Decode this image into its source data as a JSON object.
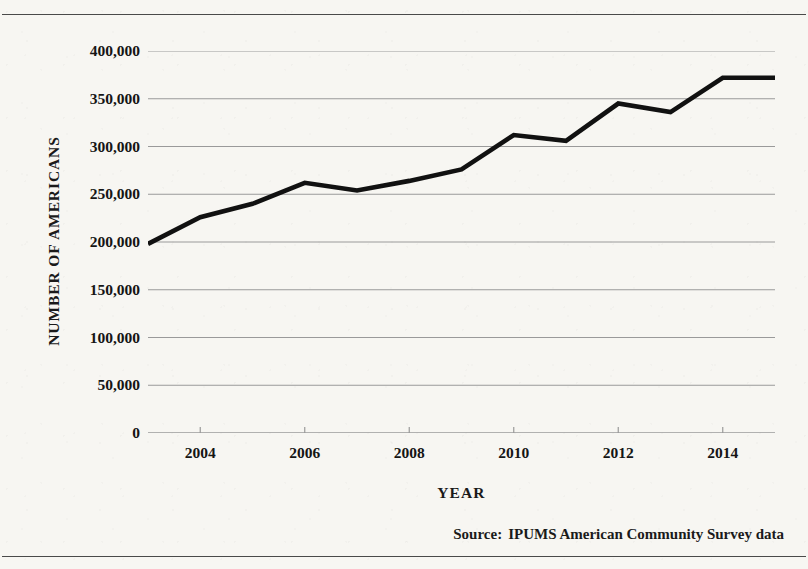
{
  "figure": {
    "y_axis_title": "NUMBER OF AMERICANS",
    "x_axis_title": "YEAR",
    "source_label": "Source:",
    "source_text": "IPUMS American Community Survey data",
    "line_color": "#111111",
    "gridline_color": "#9a9a9a",
    "paper_color": "#f7f6f2",
    "rule_color": "#4a4a4a"
  },
  "chart_data": {
    "type": "line",
    "title": "",
    "subtitle": "",
    "xlabel": "YEAR",
    "ylabel": "NUMBER OF AMERICANS",
    "x": [
      2003,
      2004,
      2005,
      2006,
      2007,
      2008,
      2009,
      2010,
      2011,
      2012,
      2013,
      2014,
      2015
    ],
    "values": [
      198000,
      226000,
      240000,
      262000,
      254000,
      264000,
      276000,
      312000,
      306000,
      345000,
      336000,
      372000,
      372000
    ],
    "series": [
      {
        "name": "Number of Americans",
        "values": [
          198000,
          226000,
          240000,
          262000,
          254000,
          264000,
          276000,
          312000,
          306000,
          345000,
          336000,
          372000,
          372000
        ]
      }
    ],
    "xlim": [
      2003,
      2015
    ],
    "ylim": [
      0,
      400000
    ],
    "xticks": [
      2004,
      2006,
      2008,
      2010,
      2012,
      2014
    ],
    "xticklabels": [
      "2004",
      "2006",
      "2008",
      "2010",
      "2012",
      "2014"
    ],
    "yticks": [
      0,
      50000,
      100000,
      150000,
      200000,
      250000,
      300000,
      350000,
      400000
    ],
    "yticklabels": [
      "0",
      "50,000",
      "100,000",
      "150,000",
      "200,000",
      "250,000",
      "300,000",
      "350,000",
      "400,000"
    ],
    "grid": "horizontal",
    "legend": "none",
    "annotations": [
      "Source:  IPUMS American Community Survey data"
    ]
  }
}
